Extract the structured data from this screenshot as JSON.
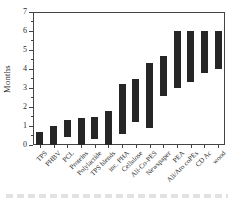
{
  "chart_data": {
    "type": "bar",
    "subtype": "floating_range_bars",
    "orientation": "vertical",
    "title": "",
    "xlabel": "",
    "ylabel": "Months",
    "ylim": [
      0,
      7
    ],
    "yticks": [
      0,
      1,
      2,
      3,
      4,
      5,
      6,
      7
    ],
    "minor_tick_step": 0.5,
    "grid": false,
    "legend": false,
    "bar_color": "#262626",
    "axis_color": "#444444",
    "categories": [
      "TPS",
      "PHBV",
      "PCL",
      "Proteins",
      "Polylactide",
      "TPS blends",
      "inc. PHA",
      "Cellulose",
      "Ali-Co-PES",
      "Newspaper",
      "PEA",
      "Ali/Aro coPEs",
      "CD Ac",
      "wood"
    ],
    "series": [
      {
        "name": "Biodegradation time range (months)",
        "ranges": [
          [
            0,
            0.7
          ],
          [
            0,
            1.0
          ],
          [
            0.4,
            1.3
          ],
          [
            0,
            1.4
          ],
          [
            0.3,
            1.5
          ],
          [
            0,
            1.8
          ],
          [
            0.6,
            3.2
          ],
          [
            1.2,
            3.5
          ],
          [
            0.9,
            4.3
          ],
          [
            2.6,
            4.7
          ],
          [
            3.0,
            6.0
          ],
          [
            3.3,
            6.0
          ],
          [
            3.8,
            6.0
          ],
          [
            4.0,
            6.0
          ]
        ]
      }
    ]
  }
}
